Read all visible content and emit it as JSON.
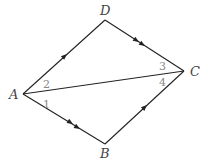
{
  "diagram": {
    "type": "quadrilateral with diagonal",
    "vertices": {
      "A": {
        "label": "A",
        "x": 23,
        "y": 94
      },
      "B": {
        "label": "B",
        "x": 105,
        "y": 144
      },
      "C": {
        "label": "C",
        "x": 184,
        "y": 71
      },
      "D": {
        "label": "D",
        "x": 105,
        "y": 20
      }
    },
    "segments": [
      {
        "from": "A",
        "to": "D",
        "arrows": 1
      },
      {
        "from": "D",
        "to": "C",
        "arrows": 2
      },
      {
        "from": "A",
        "to": "B",
        "arrows": 2
      },
      {
        "from": "B",
        "to": "C",
        "arrows": 1
      },
      {
        "from": "A",
        "to": "C",
        "arrows": 0
      }
    ],
    "angle_labels": [
      "1",
      "2",
      "3",
      "4"
    ],
    "line_color": "#222222"
  }
}
